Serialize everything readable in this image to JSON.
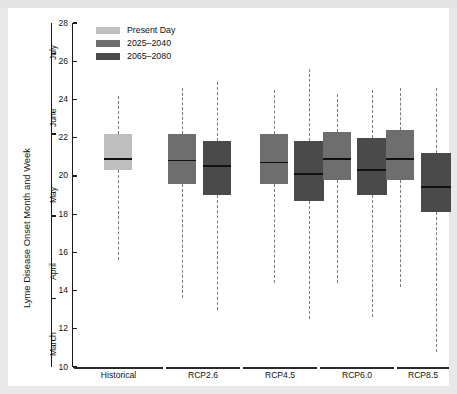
{
  "figure": {
    "background": "#e8e8e8",
    "panel_background": "#ffffff"
  },
  "legend": {
    "position": "top-left-inside",
    "items": [
      {
        "label": "Present Day",
        "color": "#bfbfbf"
      },
      {
        "label": "2025–2040",
        "color": "#6e6e6e"
      },
      {
        "label": "2065–2080",
        "color": "#4a4a4a"
      }
    ]
  },
  "axes": {
    "y_title": "Lyme Disease Onset Month and Week",
    "y_ticks": [
      10,
      12,
      14,
      16,
      18,
      20,
      22,
      24,
      26,
      28
    ],
    "y_tick_labels": [
      "10",
      "12",
      "14",
      "16",
      "18",
      "20",
      "22",
      "24",
      "26",
      "28"
    ],
    "ylim": [
      10,
      28
    ],
    "month_ticks": [
      {
        "label": "March",
        "value": 11.5
      },
      {
        "label": "April",
        "value": 15.5
      },
      {
        "label": "May",
        "value": 19.5
      },
      {
        "label": "June",
        "value": 23.5
      },
      {
        "label": "July",
        "value": 27.0
      }
    ],
    "month_boundaries": [
      13.6,
      17.9,
      22.2,
      26.4
    ],
    "x_groups": [
      "Historical",
      "RCP2.6",
      "RCP4.5",
      "RCP6.0",
      "RCP8.5"
    ],
    "grid": false
  },
  "chart_data": {
    "type": "box",
    "title": "",
    "xlabel": "",
    "ylabel": "Lyme Disease Onset Month and Week",
    "ylim": [
      10,
      28
    ],
    "categories": [
      "Historical",
      "RCP2.6",
      "RCP4.5",
      "RCP6.0",
      "RCP8.5"
    ],
    "series": [
      {
        "name": "Present Day",
        "color": "#bfbfbf"
      },
      {
        "name": "2025–2040",
        "color": "#6e6e6e"
      },
      {
        "name": "2065–2080",
        "color": "#4a4a4a"
      }
    ],
    "boxes": [
      {
        "group": "Historical",
        "series": "Present Day",
        "color": "#bfbfbf",
        "whisker_low": 15.6,
        "q1": 20.3,
        "median": 20.9,
        "q3": 22.2,
        "whisker_high": 24.2,
        "cx": 110,
        "half_width": 14
      },
      {
        "group": "RCP2.6",
        "series": "2025–2040",
        "color": "#6e6e6e",
        "whisker_low": 13.6,
        "q1": 19.6,
        "median": 20.8,
        "q3": 22.2,
        "whisker_high": 24.6,
        "cx": 174,
        "half_width": 14
      },
      {
        "group": "RCP2.6",
        "series": "2065–2080",
        "color": "#4a4a4a",
        "whisker_low": 13.0,
        "q1": 19.0,
        "median": 20.5,
        "q3": 21.8,
        "whisker_high": 24.9,
        "cx": 209,
        "half_width": 14
      },
      {
        "group": "RCP4.5",
        "series": "2025–2040",
        "color": "#6e6e6e",
        "whisker_low": 14.4,
        "q1": 19.6,
        "median": 20.7,
        "q3": 22.2,
        "whisker_high": 24.5,
        "cx": 266,
        "half_width": 14
      },
      {
        "group": "RCP4.5",
        "series": "2065–2080",
        "color": "#4a4a4a",
        "whisker_low": 12.5,
        "q1": 18.7,
        "median": 20.1,
        "q3": 21.8,
        "whisker_high": 25.6,
        "cx": 301,
        "half_width": 15
      },
      {
        "group": "RCP6.0",
        "series": "2025–2040",
        "color": "#6e6e6e",
        "whisker_low": 14.4,
        "q1": 19.8,
        "median": 20.9,
        "q3": 22.3,
        "whisker_high": 24.3,
        "cx": 329,
        "half_width": 14
      },
      {
        "group": "RCP6.0",
        "series": "2065–2080",
        "color": "#4a4a4a",
        "whisker_low": 12.6,
        "q1": 19.0,
        "median": 20.3,
        "q3": 22.0,
        "whisker_high": 24.5,
        "cx": 364,
        "half_width": 15
      },
      {
        "group": "RCP8.5",
        "series": "2025–2040",
        "color": "#6e6e6e",
        "whisker_low": 14.2,
        "q1": 19.8,
        "median": 20.9,
        "q3": 22.4,
        "whisker_high": 24.6,
        "cx": 392,
        "half_width": 14
      },
      {
        "group": "RCP8.5",
        "series": "2065–2080",
        "color": "#4a4a4a",
        "whisker_low": 10.8,
        "q1": 18.1,
        "median": 19.4,
        "q3": 21.2,
        "whisker_high": 24.6,
        "cx": 428,
        "half_width": 15
      }
    ]
  }
}
